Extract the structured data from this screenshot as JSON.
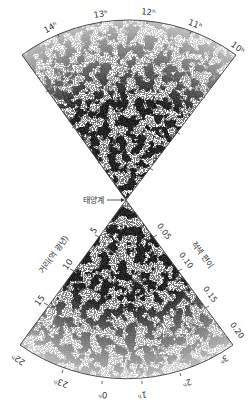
{
  "diagram": {
    "apex_label": "태양계",
    "upper_wedge": {
      "ra_ticks": [
        {
          "label": "14ʰ",
          "angle": -38
        },
        {
          "label": "13ʰ",
          "angle": -15
        },
        {
          "label": "12ʰ",
          "angle": 4
        },
        {
          "label": "11ʰ",
          "angle": 24
        },
        {
          "label": "10ʰ",
          "angle": 45
        }
      ]
    },
    "lower_wedge": {
      "ra_ticks": [
        {
          "label": "22ʰ",
          "angle": -48
        },
        {
          "label": "23ʰ",
          "angle": -25
        },
        {
          "label": "0ʰ",
          "angle": -3
        },
        {
          "label": "1ʰ",
          "angle": 9
        },
        {
          "label": "2ʰ",
          "angle": 25
        },
        {
          "label": "3ʰ",
          "angle": 45
        }
      ],
      "distance_axis": {
        "title": "거리(억 광년)",
        "ticks": [
          "5",
          "10",
          "15"
        ]
      },
      "redshift_axis": {
        "title": "적색 편이",
        "ticks": [
          "0.05",
          "0.10",
          "0.15",
          "0.20"
        ]
      }
    }
  }
}
